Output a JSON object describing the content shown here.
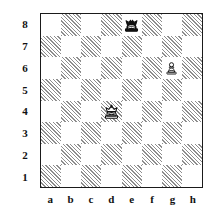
{
  "diagram": {
    "type": "chess-board-diagram",
    "orientation": "white-bottom",
    "rank_labels": [
      "8",
      "7",
      "6",
      "5",
      "4",
      "3",
      "2",
      "1"
    ],
    "file_labels": [
      "a",
      "b",
      "c",
      "d",
      "e",
      "f",
      "g",
      "h"
    ],
    "colors": {
      "light_square": "#ffffff",
      "dark_square_hatch": "#8d8d8d",
      "border": "#1a1a1a",
      "label": "#111111",
      "white_piece_fill": "#ffffff",
      "black_piece_fill": "#101010",
      "piece_outline": "#101010"
    },
    "pieces": [
      {
        "square": "e8",
        "color": "black",
        "type": "king",
        "glyph": "black-king-icon"
      },
      {
        "square": "g6",
        "color": "white",
        "type": "pawn",
        "glyph": "white-pawn-icon"
      },
      {
        "square": "d4",
        "color": "white",
        "type": "king",
        "glyph": "white-king-icon"
      }
    ],
    "position_summary": "Black king e8, White king d4, White pawn g6"
  }
}
